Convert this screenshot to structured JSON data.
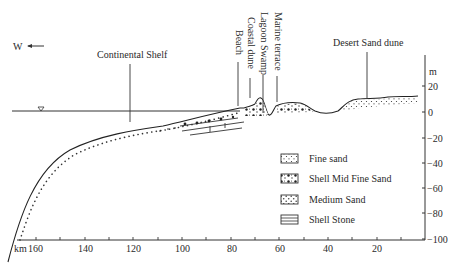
{
  "diagram": {
    "type": "geological cross-section profile",
    "direction": {
      "label": "W",
      "arrow": "left-arrow-icon"
    },
    "y_axis": {
      "unit": "m",
      "ticks": [
        "20",
        "0",
        "−20",
        "−40",
        "−60",
        "−80",
        "−100"
      ],
      "values": [
        20,
        0,
        -20,
        -40,
        -60,
        -80,
        -100
      ]
    },
    "x_axis": {
      "unit": "km",
      "ticks": [
        "160",
        "140",
        "120",
        "100",
        "80",
        "60",
        "40",
        "20"
      ],
      "values": [
        160,
        140,
        120,
        100,
        80,
        60,
        40,
        20
      ],
      "minor_every": 10
    },
    "features": {
      "continental_shelf": "Continental Shelf",
      "beach": "Beach",
      "coastal_dune": "Coastal dune",
      "lagoon_swamp": "Lagoon Swamp",
      "marine_terrace": "Marine terrace",
      "desert_sand_dune": "Desert Sand dune"
    },
    "sea_level_symbol": "water-level-triangle-icon",
    "legend": [
      {
        "pattern": "fine-sand",
        "label": "Fine sand"
      },
      {
        "pattern": "shell-mid-fine-sand",
        "label": "Shell Mid Fine Sand"
      },
      {
        "pattern": "medium-sand",
        "label": "Medium Sand"
      },
      {
        "pattern": "shell-stone",
        "label": "Shell Stone"
      }
    ],
    "colors": {
      "line": "#2a2a2a",
      "background": "#ffffff"
    }
  }
}
